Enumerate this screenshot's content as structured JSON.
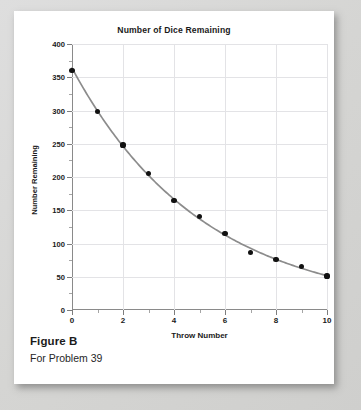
{
  "figure": {
    "label": "Figure B",
    "subtitle": "For Problem 39"
  },
  "chart_data": {
    "type": "scatter",
    "title": "Number of Dice Remaining",
    "xlabel": "Throw Number",
    "ylabel": "Number Remaining",
    "x": [
      0,
      1,
      2,
      3,
      4,
      5,
      6,
      7,
      8,
      9,
      10
    ],
    "values": [
      360,
      298,
      248,
      205,
      165,
      141,
      115,
      87,
      76,
      65,
      51
    ],
    "series": [
      {
        "name": "Number Remaining",
        "values": [
          360,
          298,
          248,
          205,
          165,
          141,
          115,
          87,
          76,
          65,
          51
        ]
      }
    ],
    "xlim": [
      0,
      10
    ],
    "ylim": [
      0,
      400
    ],
    "xticks": [
      0,
      2,
      4,
      6,
      8,
      10
    ],
    "xticks_minor": [
      1,
      3,
      5,
      7,
      9
    ],
    "yticks": [
      0,
      50,
      100,
      150,
      200,
      250,
      300,
      350,
      400
    ],
    "xtick_labels": [
      "0",
      "2",
      "4",
      "6",
      "8",
      "10"
    ],
    "ytick_labels": [
      "0",
      "50",
      "100",
      "150",
      "200",
      "250",
      "300",
      "350",
      "400"
    ],
    "grid": true,
    "legend": "none",
    "marker_color": "#111111",
    "line_color": "#8c8c8c",
    "grid_color": "#e3e3e6",
    "axis_color": "#8a8a8a",
    "trend_line": true
  }
}
